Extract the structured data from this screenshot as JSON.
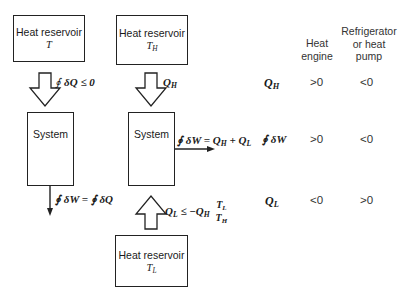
{
  "diagram": {
    "left": {
      "reservoir": {
        "label": "Heat reservoir",
        "temp": "T"
      },
      "heat_arrow_label": {
        "prefix": "∮",
        "text": "δQ ≤ 0"
      },
      "system": {
        "label": "System",
        "cycle_icon": "clockwise-cycle"
      },
      "work_arrow_label": {
        "text": "∮ δW = ∮ δQ"
      }
    },
    "right": {
      "hot_reservoir": {
        "label": "Heat reservoir",
        "temp": "T",
        "temp_sub": "H"
      },
      "hot_arrow_label": {
        "q": "Q",
        "sub": "H"
      },
      "system": {
        "label": "System",
        "cycle_icon": "clockwise-cycle"
      },
      "work_arrow_label": {
        "lhs": "∮ δW =",
        "q1": "Q",
        "q1_sub": "H",
        "plus": "+",
        "q2": "Q",
        "q2_sub": "L"
      },
      "cold_arrow_label": {
        "q": "Q",
        "q_sub": "L",
        "op": "≤ −",
        "qh": "Q",
        "qh_sub": "H",
        "num": "T",
        "num_sub": "L",
        "den": "T",
        "den_sub": "H"
      },
      "cold_reservoir": {
        "label": "Heat reservoir",
        "temp": "T",
        "temp_sub": "L"
      }
    },
    "colors": {
      "line": "#222222",
      "text": "#1a1a1a",
      "table_text": "#333333"
    }
  },
  "table": {
    "columns": [
      {
        "lines": [
          "Heat",
          "engine"
        ]
      },
      {
        "lines": [
          "Refrigerator",
          "or heat",
          "pump"
        ]
      }
    ],
    "rows": [
      {
        "label": "Q",
        "label_sub": "H",
        "values": [
          ">0",
          "<0"
        ]
      },
      {
        "label": "∮ δW",
        "label_sub": "",
        "values": [
          ">0",
          "<0"
        ]
      },
      {
        "label": "Q",
        "label_sub": "L",
        "values": [
          "<0",
          ">0"
        ]
      }
    ]
  }
}
